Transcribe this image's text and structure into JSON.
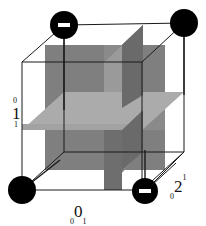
{
  "figure": {
    "type": "cube-with-three-orthogonal-planes",
    "background_color": "#ffffff",
    "line_color": "#1a1a1a",
    "plane_colors": {
      "front_face_plane": "#8a8a8a",
      "vertical_side_plane": "#767676",
      "horizontal_plane": "#ababab",
      "dark_plane": "#6e6e6e",
      "light_plane": "#9c9c9c"
    },
    "node_color": "#000000",
    "node_sign_color": "#ffffff"
  },
  "nodes": [
    {
      "id": "node-top-left",
      "sign": "minus",
      "x": 64,
      "y": 25
    },
    {
      "id": "node-top-right",
      "sign": "none",
      "x": 184,
      "y": 23
    },
    {
      "id": "node-bottom-left",
      "sign": "none",
      "x": 22,
      "y": 190
    },
    {
      "id": "node-bottom-right",
      "sign": "minus",
      "x": 145,
      "y": 191
    }
  ],
  "axis_labels": {
    "left": {
      "superscript": "0",
      "main": "1",
      "subscript": "1"
    },
    "bottom": {
      "pre_subscript": "0",
      "main": "0",
      "post_subscript": "1"
    },
    "right": {
      "pre_subscript": "0",
      "main": "2",
      "post_superscript": "1"
    }
  },
  "minus_sign_glyph": "−"
}
